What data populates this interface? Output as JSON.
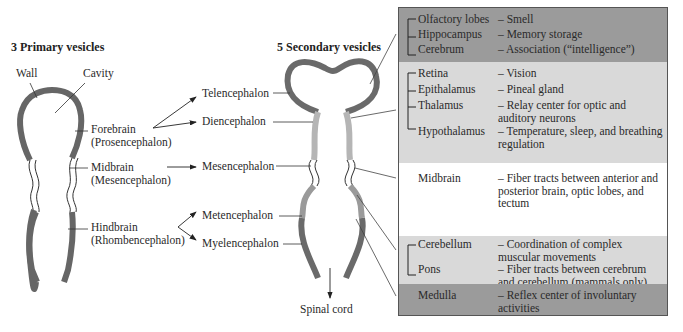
{
  "primary": {
    "title": "3 Primary vesicles",
    "wall_label": "Wall",
    "cavity_label": "Cavity",
    "vesicles": [
      {
        "name": "Forebrain",
        "latin": "(Prosencephalon)"
      },
      {
        "name": "Midbrain",
        "latin": "(Mesencephalon)"
      },
      {
        "name": "Hindbrain",
        "latin": "(Rhombencephalon)"
      }
    ]
  },
  "secondary": {
    "title": "5 Secondary vesicles",
    "vesicles": [
      "Telencephalon",
      "Diencephalon",
      "Mesencephalon",
      "Metencephalon",
      "Myelencephalon"
    ],
    "spinal_cord": "Spinal cord"
  },
  "adult_structures": {
    "sections": [
      {
        "shade": "#9b9b9b",
        "items": [
          {
            "structure": "Olfactory lobes",
            "function": "– Smell"
          },
          {
            "structure": "Hippocampus",
            "function": "– Memory storage"
          },
          {
            "structure": "Cerebrum",
            "function": "– Association (“intelligence”)"
          }
        ]
      },
      {
        "shade": "#d9d9d9",
        "items": [
          {
            "structure": "Retina",
            "function": "– Vision"
          },
          {
            "structure": "Epithalamus",
            "function": "– Pineal gland"
          },
          {
            "structure": "Thalamus",
            "function": "– Relay center for optic and auditory neurons"
          },
          {
            "structure": "Hypothalamus",
            "function": "– Temperature, sleep, and breathing regulation"
          }
        ]
      },
      {
        "shade": "#ffffff",
        "items": [
          {
            "structure": "Midbrain",
            "function": "– Fiber tracts between anterior and posterior brain, optic lobes, and tectum"
          }
        ]
      },
      {
        "shade": "#d9d9d9",
        "items": [
          {
            "structure": "Cerebellum",
            "function": "– Coordination of complex muscular movements"
          },
          {
            "structure": "Pons",
            "function": "– Fiber tracts between cerebrum and cerebellum (mammals only)"
          }
        ]
      },
      {
        "shade": "#9b9b9b",
        "items": [
          {
            "structure": "Medulla",
            "function": "– Reflex center of involuntary activities"
          }
        ]
      }
    ]
  }
}
